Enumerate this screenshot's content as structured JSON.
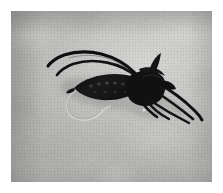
{
  "image": {
    "type": "photograph",
    "subject": "fly-fishing-lure-stonefly-nymph",
    "alt_text": "Dark artificial fly-fishing lure resembling a stonefly nymph lying on a mottled gray stone surface",
    "orientation": "landscape",
    "border": {
      "style": "white-mat-with-thin-gray-frame",
      "mat_color": "#ffffff",
      "frame_line_color": "#8a8a8a",
      "mat_width_px": 11
    },
    "canvas": {
      "width_px": 223,
      "height_px": 193
    },
    "photo_area": {
      "x_px": 11,
      "y_px": 11,
      "width_px": 201,
      "height_px": 171
    }
  },
  "background": {
    "name": "stone-slab",
    "description": "mottled light-gray concrete or stone with fine grain and faint diagonal scratches",
    "base_color": "#c6c6c4",
    "light_color": "#dcdcda",
    "shadow_color": "#a8a8a6",
    "grain": "fine",
    "vignette": "darker along left and top edges"
  },
  "subject": {
    "name": "fly-lure",
    "common_name": "stonefly nymph fly",
    "body_color": "#151515",
    "highlight_color": "#4a4a4a",
    "hook_color": "#c9c9c5",
    "shadow_color": "#8e8e8c",
    "pose": "lying diagonally, head and antennae toward upper-left, tails toward lower-right",
    "parts": [
      {
        "name": "antennae",
        "count": 2,
        "description": "two long black tapering antennae curving up and to the left"
      },
      {
        "name": "thorax",
        "count": 1,
        "description": "bulky dark thorax with raised wing-case"
      },
      {
        "name": "abdomen",
        "count": 1,
        "description": "segmented dark abdomen with lighter banding dots"
      },
      {
        "name": "legs",
        "count": 2,
        "description": "dark legs splayed below the thorax"
      },
      {
        "name": "tails",
        "count": 3,
        "description": "three long black tails sweeping to the lower-right"
      },
      {
        "name": "hook",
        "count": 1,
        "description": "silver hook bend and point visible beneath the abdomen"
      }
    ]
  }
}
